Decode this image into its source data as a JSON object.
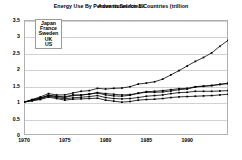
{
  "title": {
    "primary": "Energy Use By Person in Selected Countries (trillion",
    "overlay": "Adventures for 19"
  },
  "legend": {
    "position": "top-left-inside",
    "entries": [
      "Japan",
      "France",
      "Sweden",
      "UK",
      "US"
    ]
  },
  "axes": {
    "y_ticks": [
      "0",
      "0.5",
      "1",
      "1.5",
      "2",
      "2.5",
      "3",
      "3.5"
    ],
    "x_ticks": [
      "1970",
      "1975",
      "1980",
      "1985",
      "1990"
    ]
  },
  "chart_data": {
    "type": "line",
    "title": "Energy Use By Person in Selected Countries (trillion",
    "xlabel": "",
    "ylabel": "",
    "xlim": [
      1970,
      1995
    ],
    "ylim": [
      0,
      3.5
    ],
    "grid": true,
    "legend_position": "top-left-inside",
    "marker": "small-filled-square",
    "line_color": "#000000",
    "x": [
      1970,
      1971,
      1972,
      1973,
      1974,
      1975,
      1976,
      1977,
      1978,
      1979,
      1980,
      1981,
      1982,
      1983,
      1984,
      1985,
      1986,
      1987,
      1988,
      1989,
      1990,
      1991,
      1992,
      1993,
      1994,
      1995
    ],
    "series": [
      {
        "name": "Japan",
        "values": [
          1.0,
          1.08,
          1.16,
          1.26,
          1.22,
          1.22,
          1.28,
          1.33,
          1.35,
          1.42,
          1.4,
          1.42,
          1.43,
          1.47,
          1.55,
          1.58,
          1.62,
          1.7,
          1.83,
          1.96,
          2.1,
          2.24,
          2.36,
          2.5,
          2.7,
          2.88
        ]
      },
      {
        "name": "France",
        "values": [
          1.0,
          1.06,
          1.12,
          1.2,
          1.17,
          1.14,
          1.2,
          1.21,
          1.25,
          1.29,
          1.26,
          1.24,
          1.22,
          1.23,
          1.27,
          1.3,
          1.3,
          1.31,
          1.34,
          1.38,
          1.4,
          1.46,
          1.48,
          1.5,
          1.54,
          1.58
        ]
      },
      {
        "name": "Sweden",
        "values": [
          1.0,
          1.07,
          1.13,
          1.21,
          1.18,
          1.16,
          1.22,
          1.22,
          1.24,
          1.28,
          1.22,
          1.19,
          1.18,
          1.21,
          1.27,
          1.32,
          1.33,
          1.35,
          1.38,
          1.41,
          1.42,
          1.47,
          1.49,
          1.51,
          1.54,
          1.56
        ]
      },
      {
        "name": "UK",
        "values": [
          1.0,
          1.05,
          1.1,
          1.18,
          1.14,
          1.1,
          1.13,
          1.15,
          1.17,
          1.2,
          1.14,
          1.11,
          1.1,
          1.11,
          1.14,
          1.18,
          1.2,
          1.22,
          1.26,
          1.29,
          1.3,
          1.33,
          1.33,
          1.33,
          1.34,
          1.35
        ]
      },
      {
        "name": "US",
        "values": [
          1.0,
          1.04,
          1.08,
          1.15,
          1.11,
          1.06,
          1.09,
          1.1,
          1.11,
          1.12,
          1.06,
          1.03,
          1.0,
          1.02,
          1.06,
          1.08,
          1.09,
          1.11,
          1.14,
          1.16,
          1.17,
          1.18,
          1.19,
          1.2,
          1.22,
          1.24
        ]
      }
    ]
  }
}
